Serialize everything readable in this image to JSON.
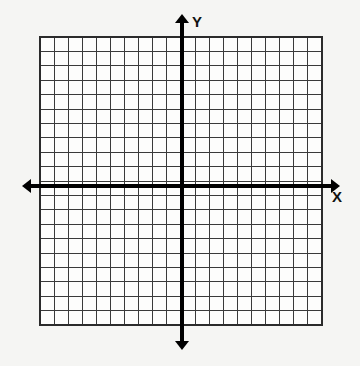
{
  "figure": {
    "kind": "cartesian-coordinate-grid",
    "title": "",
    "background_color": "#f5f5f3",
    "width": 360,
    "height": 366
  },
  "grid": {
    "columns": 20,
    "rows": 20,
    "cell_size_px": 14.1,
    "left_px": 40,
    "top_px": 37,
    "right_px": 322,
    "bottom_px": 325,
    "line_color": "#3a3a3a",
    "line_width_px": 1,
    "border_color": "#2b2b2b",
    "border_width_px": 1.6,
    "cell_fill": "#fdfdfc"
  },
  "axes": {
    "color": "#000000",
    "line_width_px": 4,
    "arrow_size_px": 9,
    "x_axis": {
      "label": "X",
      "label_x_px": 337,
      "label_y_px": 202,
      "y_px": 186,
      "start_x_px": 22,
      "end_x_px": 340,
      "arrow_left": true,
      "arrow_right": true,
      "units_negative": 10,
      "units_positive": 10,
      "tick_labels": []
    },
    "y_axis": {
      "label": "Y",
      "label_x_px": 197,
      "label_y_px": 27,
      "x_px": 182,
      "start_y_px": 14,
      "end_y_px": 350,
      "arrow_up": true,
      "arrow_down": true,
      "units_negative": 10,
      "units_positive": 10,
      "tick_labels": []
    },
    "origin": {
      "x_px": 182,
      "y_px": 186,
      "label": ""
    }
  },
  "chart_data": {
    "type": "scatter",
    "title": "",
    "xlabel": "X",
    "ylabel": "Y",
    "x": [],
    "y": [],
    "series": [],
    "xlim": [
      -10,
      10
    ],
    "ylim": [
      -10,
      10
    ],
    "xticks": [
      -10,
      -9,
      -8,
      -7,
      -6,
      -5,
      -4,
      -3,
      -2,
      -1,
      0,
      1,
      2,
      3,
      4,
      5,
      6,
      7,
      8,
      9,
      10
    ],
    "yticks": [
      -10,
      -9,
      -8,
      -7,
      -6,
      -5,
      -4,
      -3,
      -2,
      -1,
      0,
      1,
      2,
      3,
      4,
      5,
      6,
      7,
      8,
      9,
      10
    ],
    "xtick_labels": [],
    "ytick_labels": [],
    "grid": true,
    "legend": null,
    "annotations": []
  }
}
